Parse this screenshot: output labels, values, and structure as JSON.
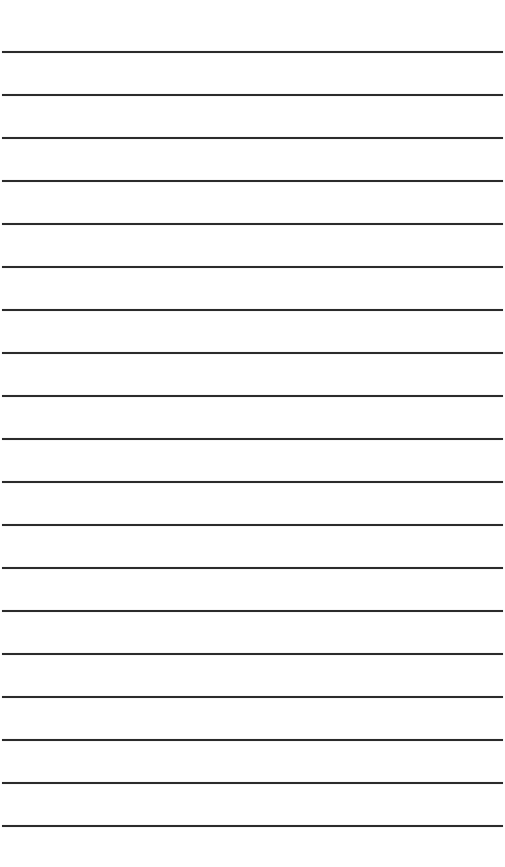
{
  "paper": {
    "background": "#ffffff",
    "line_color": "#2b2b2b",
    "line_count": 19,
    "first_line_y": 51,
    "line_spacing": 43
  }
}
